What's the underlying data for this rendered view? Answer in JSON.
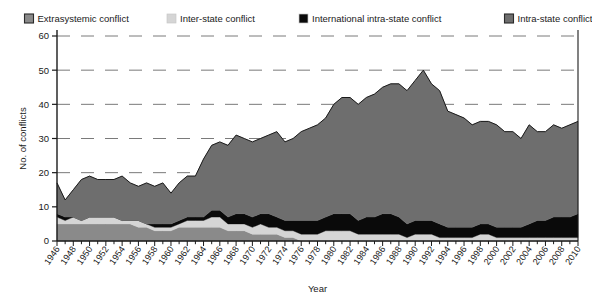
{
  "chart_data": {
    "type": "area",
    "title": "",
    "xlabel": "Year",
    "ylabel": "No. of conflicts",
    "stacked": true,
    "grid": true,
    "legend_position": "top",
    "xlim": [
      1946,
      2010
    ],
    "ylim": [
      0,
      60
    ],
    "yticks": [
      0,
      10,
      20,
      30,
      40,
      50,
      60
    ],
    "xtick_labels": [
      "1946",
      "1948",
      "1950",
      "1952",
      "1954",
      "1956",
      "1958",
      "1960",
      "1962",
      "1964",
      "1966",
      "1968",
      "1970",
      "1972",
      "1974",
      "1976",
      "1978",
      "1980",
      "1982",
      "1984",
      "1986",
      "1988",
      "1990",
      "1992",
      "1994",
      "1996",
      "1998",
      "2000",
      "2002",
      "2004",
      "2006",
      "2008",
      "2010"
    ],
    "xtick_step": 2,
    "x": [
      1946,
      1947,
      1948,
      1949,
      1950,
      1951,
      1952,
      1953,
      1954,
      1955,
      1956,
      1957,
      1958,
      1959,
      1960,
      1961,
      1962,
      1963,
      1964,
      1965,
      1966,
      1967,
      1968,
      1969,
      1970,
      1971,
      1972,
      1973,
      1974,
      1975,
      1976,
      1977,
      1978,
      1979,
      1980,
      1981,
      1982,
      1983,
      1984,
      1985,
      1986,
      1987,
      1988,
      1989,
      1990,
      1991,
      1992,
      1993,
      1994,
      1995,
      1996,
      1997,
      1998,
      1999,
      2000,
      2001,
      2002,
      2003,
      2004,
      2005,
      2006,
      2007,
      2008,
      2009,
      2010
    ],
    "series": [
      {
        "name": "Extrasystemic conflict",
        "color": "#8a8a8a",
        "values": [
          5,
          5,
          5,
          5,
          5,
          5,
          5,
          5,
          5,
          5,
          4,
          4,
          3,
          3,
          3,
          4,
          4,
          4,
          4,
          4,
          4,
          3,
          3,
          3,
          2,
          2,
          2,
          2,
          1,
          1,
          0,
          0,
          0,
          0,
          0,
          0,
          0,
          0,
          0,
          0,
          0,
          0,
          0,
          0,
          0,
          0,
          0,
          0,
          0,
          0,
          0,
          0,
          0,
          0,
          0,
          0,
          0,
          0,
          0,
          0,
          0,
          0,
          0,
          0,
          0
        ]
      },
      {
        "name": "Inter-state conflict",
        "color": "#d5d5d5",
        "values": [
          2,
          1,
          2,
          1,
          2,
          2,
          2,
          2,
          1,
          1,
          2,
          1,
          1,
          1,
          1,
          1,
          2,
          2,
          2,
          3,
          3,
          2,
          2,
          2,
          2,
          3,
          2,
          2,
          2,
          2,
          2,
          2,
          2,
          3,
          3,
          3,
          3,
          2,
          2,
          2,
          2,
          2,
          2,
          1,
          2,
          2,
          2,
          1,
          1,
          1,
          1,
          1,
          2,
          2,
          1,
          1,
          1,
          1,
          1,
          1,
          1,
          1,
          1,
          1,
          1
        ]
      },
      {
        "name": "International intra-state conflict",
        "color": "#0a0a0a",
        "values": [
          1,
          1,
          0,
          0,
          0,
          0,
          0,
          0,
          0,
          0,
          0,
          0,
          1,
          1,
          1,
          1,
          1,
          1,
          1,
          2,
          2,
          2,
          3,
          3,
          3,
          3,
          4,
          3,
          3,
          3,
          4,
          4,
          4,
          4,
          5,
          5,
          5,
          4,
          5,
          5,
          6,
          6,
          5,
          4,
          4,
          4,
          4,
          4,
          3,
          3,
          3,
          3,
          3,
          3,
          3,
          3,
          3,
          3,
          4,
          5,
          5,
          6,
          6,
          6,
          7
        ]
      },
      {
        "name": "Intra-state conflict",
        "color": "#6e6e6e",
        "values": [
          9,
          5,
          8,
          12,
          12,
          11,
          11,
          11,
          13,
          11,
          10,
          12,
          11,
          12,
          9,
          11,
          12,
          12,
          17,
          19,
          20,
          21,
          23,
          22,
          22,
          22,
          23,
          25,
          23,
          24,
          26,
          27,
          28,
          29,
          32,
          34,
          34,
          34,
          35,
          36,
          37,
          38,
          39,
          39,
          41,
          44,
          40,
          39,
          34,
          33,
          32,
          30,
          30,
          30,
          30,
          28,
          28,
          26,
          29,
          26,
          26,
          27,
          26,
          27,
          27
        ]
      }
    ],
    "totals_note": "Stacked totals peak ~52 in 1991"
  },
  "legend": {
    "items": [
      {
        "label": "Extrasystemic conflict",
        "swatch": "#8a8a8a",
        "style": "bordered"
      },
      {
        "label": "Inter-state conflict",
        "swatch": "#d5d5d5",
        "style": "plain"
      },
      {
        "label": "International intra-state conflict",
        "swatch": "#0a0a0a",
        "style": "plain"
      },
      {
        "label": "Intra-state conflict",
        "swatch": "#6e6e6e",
        "style": "bordered"
      }
    ]
  },
  "axes": {
    "y_title": "No. of conflicts",
    "x_title": "Year"
  }
}
